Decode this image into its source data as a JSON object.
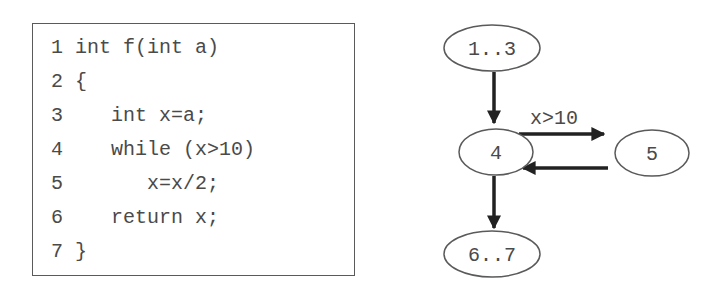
{
  "code": {
    "lines": [
      {
        "num": "1",
        "text": "int f(int a)"
      },
      {
        "num": "2",
        "text": "{"
      },
      {
        "num": "3",
        "text": "   int x=a;"
      },
      {
        "num": "4",
        "text": "   while (x>10)"
      },
      {
        "num": "5",
        "text": "      x=x/2;"
      },
      {
        "num": "6",
        "text": "   return x;"
      },
      {
        "num": "7",
        "text": "}"
      }
    ]
  },
  "graph": {
    "nodes": [
      {
        "id": "n13",
        "label": "1..3"
      },
      {
        "id": "n4",
        "label": "4"
      },
      {
        "id": "n5",
        "label": "5"
      },
      {
        "id": "n67",
        "label": "6..7"
      }
    ],
    "edges": [
      {
        "from": "1..3",
        "to": "4",
        "label": ""
      },
      {
        "from": "4",
        "to": "5",
        "label": "x>10"
      },
      {
        "from": "5",
        "to": "4",
        "label": ""
      },
      {
        "from": "4",
        "to": "6..7",
        "label": ""
      }
    ],
    "edge_label_loop": "x>10"
  },
  "colors": {
    "border": "#5a5a5a",
    "text": "#4a4a4a",
    "edge": "#222222"
  }
}
